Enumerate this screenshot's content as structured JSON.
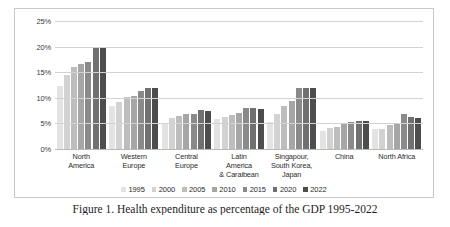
{
  "chart_data": {
    "type": "bar",
    "title": "",
    "xlabel": "",
    "ylabel": "",
    "ylim": [
      0,
      25
    ],
    "ytick_labels": [
      "25%",
      "20%",
      "15%",
      "10%",
      "5%",
      "0%"
    ],
    "ytick_values": [
      25,
      20,
      15,
      10,
      5,
      0
    ],
    "grid": true,
    "legend_position": "bottom",
    "categories": [
      "North America",
      "Western Europe",
      "Central Europe",
      "Latin America & Caraibean",
      "Singapour, South Korea, Japan",
      "China",
      "North Africa"
    ],
    "category_lines": [
      [
        "North",
        "America"
      ],
      [
        "Western",
        "Europe"
      ],
      [
        "Central",
        "Europe"
      ],
      [
        "Latin",
        "America",
        "& Caraibean"
      ],
      [
        "Singapour,",
        "South Korea,",
        "Japan"
      ],
      [
        "China"
      ],
      [
        "North Africa"
      ]
    ],
    "series": [
      {
        "name": "1995",
        "color": "#e3e3e3",
        "values": [
          12.3,
          8.4,
          5.0,
          5.9,
          5.2,
          3.5,
          3.9
        ]
      },
      {
        "name": "2000",
        "color": "#d2d2d2",
        "values": [
          14.4,
          9.1,
          6.1,
          6.2,
          6.9,
          4.1,
          4.0
        ]
      },
      {
        "name": "2005",
        "color": "#bdbdbd",
        "values": [
          16.1,
          10.1,
          6.5,
          6.6,
          8.4,
          4.3,
          4.6
        ]
      },
      {
        "name": "2010",
        "color": "#a6a6a6",
        "values": [
          16.6,
          10.3,
          6.8,
          7.1,
          9.4,
          4.9,
          5.1
        ]
      },
      {
        "name": "2015",
        "color": "#8a8a8a",
        "values": [
          17.0,
          11.4,
          6.9,
          8.0,
          12.0,
          5.2,
          6.8
        ]
      },
      {
        "name": "2020",
        "color": "#707070",
        "values": [
          19.8,
          11.9,
          7.6,
          8.1,
          12.0,
          5.4,
          6.2
        ]
      },
      {
        "name": "2022",
        "color": "#4d4d4d",
        "values": [
          19.7,
          11.9,
          7.5,
          7.9,
          12.0,
          5.5,
          6.1
        ]
      }
    ]
  },
  "caption": {
    "text": "Figure 1. Health expenditure as percentage of the GDP 1995-2022"
  }
}
